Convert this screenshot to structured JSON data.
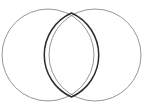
{
  "figure": {
    "kind": "venn-diagram",
    "title": "Two overlapping circles with highlighted intersection",
    "canvas": {
      "width": 151,
      "height": 112,
      "background_color": "#ffffff"
    },
    "style": {
      "circle_stroke_color": "#8a8a8a",
      "circle_stroke_width": 0.9,
      "lens_stroke_color": "#2b2b2b",
      "lens_stroke_width": 1.5,
      "fill": "none"
    },
    "shapes": {
      "left_circle": {
        "label": "left-circle",
        "center_x": 48,
        "center_y": 55,
        "radius": 46
      },
      "right_circle": {
        "label": "right-circle",
        "center_x": 95,
        "center_y": 55,
        "radius": 46
      },
      "intersection_lens": {
        "label": "intersection-lens",
        "top_point_x": 71.5,
        "top_point_y": 13,
        "bottom_point_x": 71.5,
        "bottom_point_y": 97,
        "left_extent_x": 49,
        "right_extent_x": 94,
        "path": "M 71.5 13 A 46 46 0 0 0 71.5 97 A 46 46 0 0 0 71.5 13 Z"
      }
    },
    "labels": {
      "left_region": "",
      "right_region": "",
      "overlap_region": "",
      "caption": ""
    }
  }
}
